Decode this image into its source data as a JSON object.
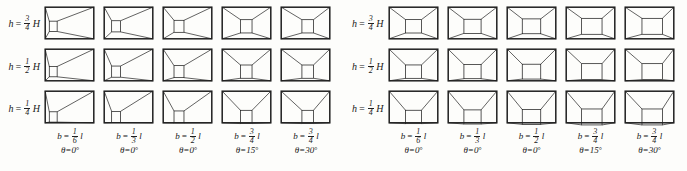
{
  "figure": {
    "type": "technical-diagram-grid",
    "background_color": "#fdfdfb",
    "line_color": "#202020"
  },
  "panels": [
    {
      "id": "left-panel",
      "inner_box_alignment": "left-offset",
      "rows": [
        {
          "label_h": "h",
          "label_eq": "=",
          "num": "3",
          "den": "4",
          "label_H": "H",
          "h_fraction": 0.75
        },
        {
          "label_h": "h",
          "label_eq": "=",
          "num": "1",
          "den": "2",
          "label_H": "H",
          "h_fraction": 0.5
        },
        {
          "label_h": "h",
          "label_eq": "=",
          "num": "1",
          "den": "4",
          "label_H": "H",
          "h_fraction": 0.25
        }
      ],
      "columns": [
        {
          "b_sym": "b",
          "b_eq": "=",
          "b_num": "1",
          "b_den": "6",
          "b_unit": "l",
          "b_fraction": 0.1667,
          "theta_sym": "θ",
          "theta_eq": "=",
          "theta_value": "0",
          "theta_unit": "°"
        },
        {
          "b_sym": "b",
          "b_eq": "=",
          "b_num": "1",
          "b_den": "3",
          "b_unit": "l",
          "b_fraction": 0.3333,
          "theta_sym": "θ",
          "theta_eq": "=",
          "theta_value": "0",
          "theta_unit": "°"
        },
        {
          "b_sym": "b",
          "b_eq": "=",
          "b_num": "1",
          "b_den": "2",
          "b_unit": "l",
          "b_fraction": 0.5,
          "theta_sym": "θ",
          "theta_eq": "=",
          "theta_value": "0",
          "theta_unit": "°"
        },
        {
          "b_sym": "b",
          "b_eq": "=",
          "b_num": "3",
          "b_den": "4",
          "b_unit": "l",
          "b_fraction": 0.75,
          "theta_sym": "θ",
          "theta_eq": "=",
          "theta_value": "15",
          "theta_unit": "°"
        },
        {
          "b_sym": "b",
          "b_eq": "=",
          "b_num": "3",
          "b_den": "4",
          "b_unit": "l",
          "b_fraction": 0.75,
          "theta_sym": "θ",
          "theta_eq": "=",
          "theta_value": "30",
          "theta_unit": "°"
        }
      ]
    },
    {
      "id": "right-panel",
      "inner_box_alignment": "centered-wide",
      "rows": [
        {
          "label_h": "h",
          "label_eq": "=",
          "num": "3",
          "den": "4",
          "label_H": "H",
          "h_fraction": 0.75
        },
        {
          "label_h": "h",
          "label_eq": "=",
          "num": "1",
          "den": "2",
          "label_H": "H",
          "h_fraction": 0.5
        },
        {
          "label_h": "h",
          "label_eq": "=",
          "num": "1",
          "den": "4",
          "label_H": "H",
          "h_fraction": 0.25
        }
      ],
      "columns": [
        {
          "b_sym": "b",
          "b_eq": "=",
          "b_num": "1",
          "b_den": "6",
          "b_unit": "l",
          "b_fraction": 0.1667,
          "theta_sym": "θ",
          "theta_eq": "=",
          "theta_value": "0",
          "theta_unit": "°"
        },
        {
          "b_sym": "b",
          "b_eq": "=",
          "b_num": "1",
          "b_den": "3",
          "b_unit": "l",
          "b_fraction": 0.3333,
          "theta_sym": "θ",
          "theta_eq": "=",
          "theta_value": "0",
          "theta_unit": "°"
        },
        {
          "b_sym": "b",
          "b_eq": "=",
          "b_num": "1",
          "b_den": "2",
          "b_unit": "l",
          "b_fraction": 0.5,
          "theta_sym": "θ",
          "theta_eq": "=",
          "theta_value": "0",
          "theta_unit": "°"
        },
        {
          "b_sym": "b",
          "b_eq": "=",
          "b_num": "3",
          "b_den": "4",
          "b_unit": "l",
          "b_fraction": 0.75,
          "theta_sym": "θ",
          "theta_eq": "=",
          "theta_value": "15",
          "theta_unit": "°"
        },
        {
          "b_sym": "b",
          "b_eq": "=",
          "b_num": "3",
          "b_den": "4",
          "b_unit": "l",
          "b_fraction": 0.75,
          "theta_sym": "θ",
          "theta_eq": "=",
          "theta_value": "30",
          "theta_unit": "°"
        }
      ]
    }
  ]
}
